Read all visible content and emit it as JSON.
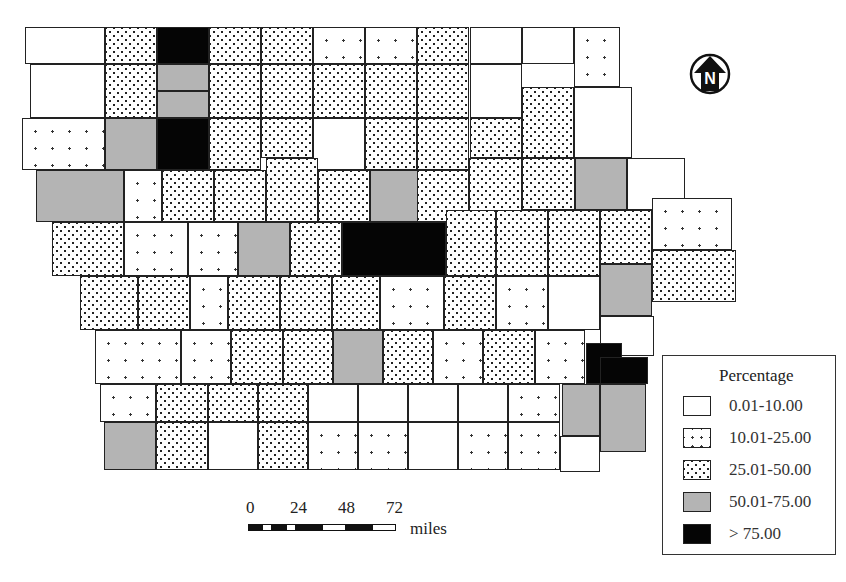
{
  "map": {
    "region": "Iowa counties",
    "categories": [
      {
        "key": "c0",
        "label": "0.01-10.00"
      },
      {
        "key": "c1",
        "label": "10.01-25.00"
      },
      {
        "key": "c2",
        "label": "25.01-50.00"
      },
      {
        "key": "c3",
        "label": "50.01-75.00"
      },
      {
        "key": "c4",
        "label": "> 75.00"
      }
    ],
    "counties": [
      [
        25,
        27,
        80,
        37,
        0
      ],
      [
        105,
        27,
        52,
        37,
        2
      ],
      [
        157,
        27,
        52,
        37,
        4
      ],
      [
        209,
        27,
        52,
        37,
        2
      ],
      [
        261,
        27,
        52,
        37,
        2
      ],
      [
        313,
        27,
        52,
        37,
        1
      ],
      [
        365,
        27,
        52,
        37,
        1
      ],
      [
        417,
        27,
        52,
        37,
        2
      ],
      [
        470,
        27,
        52,
        37,
        0
      ],
      [
        522,
        27,
        52,
        37,
        0
      ],
      [
        574,
        27,
        46,
        60,
        1
      ],
      [
        30,
        64,
        75,
        54,
        0
      ],
      [
        105,
        64,
        52,
        54,
        2
      ],
      [
        157,
        64,
        52,
        27,
        3
      ],
      [
        157,
        91,
        52,
        27,
        3
      ],
      [
        209,
        64,
        52,
        54,
        2
      ],
      [
        261,
        64,
        52,
        54,
        2
      ],
      [
        313,
        64,
        52,
        54,
        2
      ],
      [
        365,
        64,
        52,
        54,
        2
      ],
      [
        417,
        64,
        52,
        54,
        2
      ],
      [
        470,
        64,
        52,
        54,
        0
      ],
      [
        522,
        87,
        52,
        71,
        2
      ],
      [
        574,
        87,
        58,
        71,
        0
      ],
      [
        22,
        118,
        83,
        52,
        1
      ],
      [
        105,
        118,
        52,
        52,
        3
      ],
      [
        157,
        118,
        52,
        52,
        4
      ],
      [
        209,
        118,
        52,
        52,
        2
      ],
      [
        261,
        118,
        52,
        40,
        2
      ],
      [
        313,
        118,
        52,
        52,
        0
      ],
      [
        365,
        118,
        52,
        52,
        2
      ],
      [
        417,
        118,
        52,
        52,
        2
      ],
      [
        470,
        118,
        52,
        40,
        2
      ],
      [
        36,
        170,
        88,
        52,
        3
      ],
      [
        124,
        170,
        38,
        52,
        1
      ],
      [
        162,
        170,
        52,
        52,
        2
      ],
      [
        214,
        170,
        52,
        52,
        2
      ],
      [
        266,
        158,
        52,
        64,
        2
      ],
      [
        318,
        170,
        52,
        52,
        2
      ],
      [
        370,
        170,
        52,
        52,
        3
      ],
      [
        417,
        170,
        52,
        52,
        2
      ],
      [
        469,
        158,
        53,
        64,
        2
      ],
      [
        522,
        158,
        53,
        52,
        2
      ],
      [
        575,
        158,
        52,
        52,
        3
      ],
      [
        627,
        158,
        58,
        52,
        0
      ],
      [
        52,
        222,
        72,
        54,
        2
      ],
      [
        124,
        222,
        64,
        54,
        1
      ],
      [
        188,
        222,
        50,
        54,
        1
      ],
      [
        238,
        222,
        52,
        54,
        3
      ],
      [
        290,
        222,
        52,
        54,
        2
      ],
      [
        342,
        222,
        104,
        54,
        4
      ],
      [
        446,
        210,
        50,
        66,
        2
      ],
      [
        496,
        210,
        52,
        66,
        2
      ],
      [
        548,
        210,
        52,
        66,
        2
      ],
      [
        600,
        210,
        52,
        54,
        2
      ],
      [
        652,
        198,
        80,
        52,
        1
      ],
      [
        80,
        276,
        58,
        54,
        2
      ],
      [
        138,
        276,
        52,
        54,
        2
      ],
      [
        190,
        276,
        38,
        54,
        1
      ],
      [
        228,
        276,
        52,
        54,
        2
      ],
      [
        280,
        276,
        52,
        54,
        2
      ],
      [
        332,
        276,
        48,
        54,
        2
      ],
      [
        380,
        276,
        64,
        54,
        1
      ],
      [
        444,
        276,
        52,
        54,
        2
      ],
      [
        496,
        276,
        52,
        54,
        1
      ],
      [
        548,
        276,
        52,
        54,
        0
      ],
      [
        600,
        264,
        52,
        52,
        3
      ],
      [
        652,
        250,
        84,
        52,
        2
      ],
      [
        95,
        330,
        86,
        54,
        1
      ],
      [
        181,
        330,
        50,
        54,
        1
      ],
      [
        231,
        330,
        52,
        54,
        2
      ],
      [
        283,
        330,
        50,
        54,
        2
      ],
      [
        333,
        330,
        50,
        54,
        3
      ],
      [
        383,
        330,
        50,
        54,
        2
      ],
      [
        433,
        330,
        50,
        54,
        1
      ],
      [
        483,
        330,
        52,
        54,
        2
      ],
      [
        535,
        330,
        50,
        54,
        1
      ],
      [
        600,
        316,
        54,
        40,
        0
      ],
      [
        100,
        384,
        56,
        38,
        1
      ],
      [
        156,
        384,
        52,
        38,
        2
      ],
      [
        208,
        384,
        50,
        38,
        2
      ],
      [
        258,
        384,
        50,
        38,
        2
      ],
      [
        308,
        384,
        50,
        38,
        0
      ],
      [
        358,
        384,
        50,
        38,
        0
      ],
      [
        408,
        384,
        50,
        38,
        0
      ],
      [
        458,
        384,
        50,
        38,
        0
      ],
      [
        508,
        384,
        52,
        38,
        1
      ],
      [
        562,
        384,
        38,
        52,
        3
      ],
      [
        586,
        343,
        36,
        41,
        4
      ],
      [
        600,
        357,
        48,
        27,
        4
      ],
      [
        600,
        384,
        46,
        68,
        3
      ],
      [
        104,
        422,
        52,
        48,
        3
      ],
      [
        156,
        422,
        52,
        48,
        2
      ],
      [
        208,
        422,
        50,
        48,
        0
      ],
      [
        258,
        422,
        50,
        48,
        2
      ],
      [
        308,
        422,
        50,
        48,
        1
      ],
      [
        358,
        422,
        50,
        48,
        1
      ],
      [
        408,
        422,
        50,
        48,
        0
      ],
      [
        458,
        422,
        50,
        48,
        1
      ],
      [
        508,
        422,
        52,
        48,
        1
      ],
      [
        560,
        436,
        40,
        36,
        0
      ]
    ]
  },
  "legend": {
    "title": "Percentage",
    "items": [
      {
        "label": "0.01-10.00",
        "cls": "c0"
      },
      {
        "label": "10.01-25.00",
        "cls": "c1"
      },
      {
        "label": "25.01-50.00",
        "cls": "c2"
      },
      {
        "label": "50.01-75.00",
        "cls": "c3"
      },
      {
        "label": "> 75.00",
        "cls": "c4"
      }
    ]
  },
  "north_arrow": {
    "label": "N"
  },
  "scale_bar": {
    "ticks": [
      "0",
      "24",
      "48",
      "72"
    ],
    "unit": "miles"
  }
}
